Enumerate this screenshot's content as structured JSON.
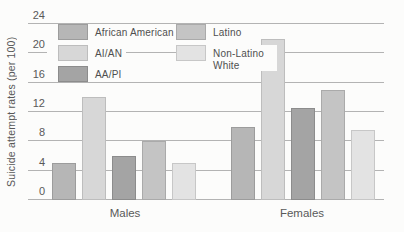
{
  "chart_data": {
    "type": "bar",
    "title": "",
    "xlabel": "",
    "ylabel": "Suicide attempt rates (per 100)",
    "categories": [
      "Males",
      "Females"
    ],
    "series": [
      {
        "name": "African American",
        "values": [
          5,
          10
        ],
        "fill": "#b6b6b6",
        "border": "#9c9c9c"
      },
      {
        "name": "AI/AN",
        "values": [
          14,
          22
        ],
        "fill": "#d7d7d7",
        "border": "#bdbdbd"
      },
      {
        "name": "AA/PI",
        "values": [
          6,
          12.5
        ],
        "fill": "#a4a4a4",
        "border": "#8c8c8c"
      },
      {
        "name": "Latino",
        "values": [
          8,
          15
        ],
        "fill": "#c4c4c4",
        "border": "#aaaaaa"
      },
      {
        "name": "Non-Latino White",
        "values": [
          5,
          9.5
        ],
        "fill": "#e3e3e3",
        "border": "#c7c7c7"
      }
    ],
    "ylim": [
      0,
      24
    ],
    "yticks": [
      0,
      4,
      8,
      12,
      16,
      20,
      24
    ],
    "grid": true,
    "legend_position": "top-left",
    "legend_columns": [
      [
        0,
        1,
        2
      ],
      [
        3,
        4
      ]
    ]
  },
  "colors": {
    "gridline": "#b3b3b3",
    "text": "#595959",
    "background": "#fcfcfb"
  }
}
